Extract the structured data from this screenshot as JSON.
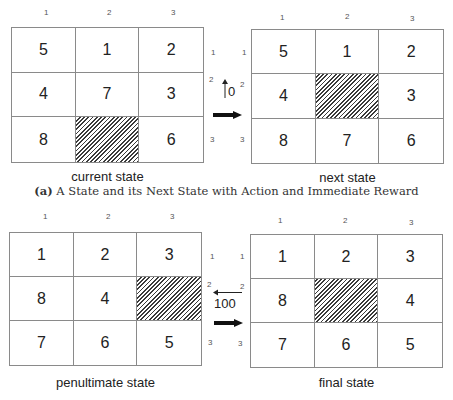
{
  "panels": [
    {
      "name": "current-state",
      "label": "current state",
      "cells": [
        "5",
        "1",
        "2",
        "4",
        "7",
        "3",
        "8",
        "",
        "6"
      ],
      "blank_index": 7
    },
    {
      "name": "next-state",
      "label": "next state",
      "cells": [
        "5",
        "1",
        "2",
        "4",
        "",
        "3",
        "8",
        "7",
        "6"
      ],
      "blank_index": 4
    },
    {
      "name": "penultimate-state",
      "label": "penultimate state",
      "cells": [
        "1",
        "2",
        "3",
        "8",
        "4",
        "",
        "7",
        "6",
        "5"
      ],
      "blank_index": 5
    },
    {
      "name": "final-state",
      "label": "final state",
      "cells": [
        "1",
        "2",
        "3",
        "8",
        "",
        "4",
        "7",
        "6",
        "5"
      ],
      "blank_index": 4
    }
  ],
  "indices": {
    "col": [
      "1",
      "2",
      "3"
    ],
    "row": [
      "1",
      "2",
      "3"
    ]
  },
  "transitions": [
    {
      "action": "up",
      "action_glyph": "↑",
      "reward": "0"
    },
    {
      "action": "left",
      "action_glyph": "←",
      "reward": "100"
    }
  ],
  "caption": {
    "tag": "(a)",
    "text": "A State and its Next State with Action and Immediate Reward"
  },
  "colors": {
    "grid_line": "#8a8a8a",
    "hatch": "#3a3a3a",
    "text": "#222222"
  }
}
